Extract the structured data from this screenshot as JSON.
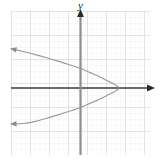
{
  "figure": {
    "width": 160,
    "height": 164,
    "background": "#ffffff"
  },
  "labels": {
    "y_axis": "y",
    "x_axis": ""
  },
  "colors": {
    "grid_minor": "#e8e8e8",
    "grid_major": "#cfcfcf",
    "axis": "#3a3a3a",
    "curve": "#9a9a9a"
  },
  "chart_data": {
    "type": "line",
    "title": "",
    "xlabel": "",
    "ylabel": "y",
    "grid": true,
    "legend": null,
    "axes": {
      "origin_px": [
        80,
        88
      ],
      "unit_px_x": 19,
      "unit_px_y": 24,
      "xlim": [
        -3.6,
        3.7
      ],
      "ylim": [
        -2.8,
        3.2
      ],
      "x_axis_arrow": "right",
      "y_axis_arrow": "up",
      "tick_labels_x": [],
      "tick_labels_y": []
    },
    "curves": [
      {
        "name": "leftward-opening parabola",
        "orientation": "opens-left",
        "vertex": [
          2.05,
          0
        ],
        "y_intercepts": [
          1.42,
          -1.42
        ],
        "endpoints": [
          [
            -3.58,
            1.63
          ],
          [
            -3.58,
            -1.5
          ]
        ],
        "arrowheads": [
          "start",
          "end"
        ],
        "equation": "x = 2.05 - 1.02*y^2",
        "points": [
          [
            -3.58,
            1.63
          ],
          [
            -3.0,
            1.52
          ],
          [
            -2.4,
            1.4
          ],
          [
            -1.8,
            1.27
          ],
          [
            -1.2,
            1.13
          ],
          [
            -0.6,
            0.98
          ],
          [
            0.0,
            0.82
          ],
          [
            0.5,
            0.65
          ],
          [
            1.0,
            0.48
          ],
          [
            1.4,
            0.32
          ],
          [
            1.7,
            0.2
          ],
          [
            1.9,
            0.11
          ],
          [
            2.05,
            0.0
          ],
          [
            1.9,
            -0.11
          ],
          [
            1.7,
            -0.2
          ],
          [
            1.4,
            -0.32
          ],
          [
            1.0,
            -0.48
          ],
          [
            0.5,
            -0.65
          ],
          [
            0.0,
            -0.82
          ],
          [
            -0.6,
            -0.98
          ],
          [
            -1.2,
            -1.13
          ],
          [
            -1.8,
            -1.27
          ],
          [
            -2.4,
            -1.4
          ],
          [
            -3.0,
            -1.48
          ],
          [
            -3.58,
            -1.5
          ]
        ]
      }
    ]
  }
}
